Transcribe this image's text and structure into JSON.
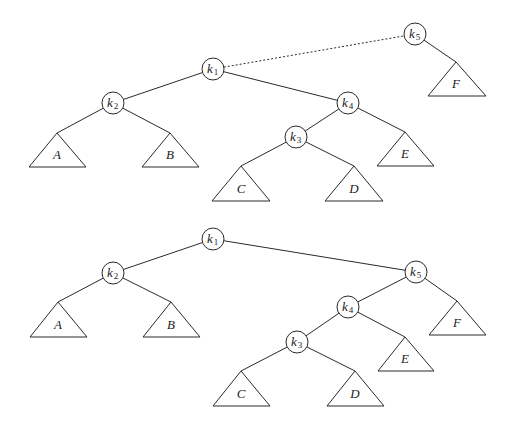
{
  "diagram": {
    "type": "binary-tree-rotation",
    "trees": [
      {
        "id": "top",
        "nodes": [
          {
            "id": "k1",
            "base": "k",
            "sub": "1",
            "x": 213,
            "y": 69
          },
          {
            "id": "k2",
            "base": "k",
            "sub": "2",
            "x": 113,
            "y": 103
          },
          {
            "id": "k4",
            "base": "k",
            "sub": "4",
            "x": 348,
            "y": 103
          },
          {
            "id": "k3",
            "base": "k",
            "sub": "3",
            "x": 296,
            "y": 137
          },
          {
            "id": "k5",
            "base": "k",
            "sub": "5",
            "x": 415,
            "y": 34
          }
        ],
        "subtrees": [
          {
            "label": "A",
            "apex": [
              57,
              133
            ],
            "baseY": 167,
            "left": 29,
            "right": 86
          },
          {
            "label": "B",
            "apex": [
              170,
              133
            ],
            "baseY": 167,
            "left": 142,
            "right": 199
          },
          {
            "label": "C",
            "apex": [
              241,
              166
            ],
            "baseY": 201,
            "left": 212,
            "right": 270
          },
          {
            "label": "D",
            "apex": [
              354,
              166
            ],
            "baseY": 201,
            "left": 325,
            "right": 383
          },
          {
            "label": "E",
            "apex": [
              405,
              132
            ],
            "baseY": 166,
            "left": 377,
            "right": 434
          },
          {
            "label": "F",
            "apex": [
              456,
              62
            ],
            "baseY": 96,
            "left": 428,
            "right": 486
          }
        ],
        "edges": [
          {
            "from": "k1",
            "to": "k2",
            "style": "solid"
          },
          {
            "from": "k1",
            "to": "k4",
            "style": "solid"
          },
          {
            "from": "k1",
            "to": "k5",
            "style": "dashed"
          },
          {
            "from": "k2",
            "to": "A",
            "style": "solid"
          },
          {
            "from": "k2",
            "to": "B",
            "style": "solid"
          },
          {
            "from": "k4",
            "to": "k3",
            "style": "solid"
          },
          {
            "from": "k4",
            "to": "E",
            "style": "solid"
          },
          {
            "from": "k3",
            "to": "C",
            "style": "solid"
          },
          {
            "from": "k3",
            "to": "D",
            "style": "solid"
          },
          {
            "from": "k5",
            "to": "F",
            "style": "solid"
          }
        ]
      },
      {
        "id": "bottom",
        "nodes": [
          {
            "id": "k1",
            "base": "k",
            "sub": "1",
            "x": 213,
            "y": 239
          },
          {
            "id": "k2",
            "base": "k",
            "sub": "2",
            "x": 113,
            "y": 273
          },
          {
            "id": "k5",
            "base": "k",
            "sub": "5",
            "x": 416,
            "y": 272
          },
          {
            "id": "k4",
            "base": "k",
            "sub": "4",
            "x": 348,
            "y": 307
          },
          {
            "id": "k3",
            "base": "k",
            "sub": "3",
            "x": 297,
            "y": 342
          }
        ],
        "subtrees": [
          {
            "label": "A",
            "apex": [
              58,
              302
            ],
            "baseY": 337,
            "left": 30,
            "right": 87
          },
          {
            "label": "B",
            "apex": [
              171,
              302
            ],
            "baseY": 337,
            "left": 143,
            "right": 200
          },
          {
            "label": "C",
            "apex": [
              241,
              371
            ],
            "baseY": 406,
            "left": 213,
            "right": 270
          },
          {
            "label": "D",
            "apex": [
              355,
              371
            ],
            "baseY": 406,
            "left": 327,
            "right": 384
          },
          {
            "label": "E",
            "apex": [
              405,
              337
            ],
            "baseY": 371,
            "left": 378,
            "right": 434
          },
          {
            "label": "F",
            "apex": [
              457,
              301
            ],
            "baseY": 335,
            "left": 429,
            "right": 486
          }
        ],
        "edges": [
          {
            "from": "k1",
            "to": "k2",
            "style": "solid"
          },
          {
            "from": "k1",
            "to": "k5",
            "style": "solid"
          },
          {
            "from": "k2",
            "to": "A",
            "style": "solid"
          },
          {
            "from": "k2",
            "to": "B",
            "style": "solid"
          },
          {
            "from": "k5",
            "to": "k4",
            "style": "solid"
          },
          {
            "from": "k5",
            "to": "F",
            "style": "solid"
          },
          {
            "from": "k4",
            "to": "k3",
            "style": "solid"
          },
          {
            "from": "k4",
            "to": "E",
            "style": "solid"
          },
          {
            "from": "k3",
            "to": "C",
            "style": "solid"
          },
          {
            "from": "k3",
            "to": "D",
            "style": "solid"
          }
        ]
      }
    ]
  }
}
